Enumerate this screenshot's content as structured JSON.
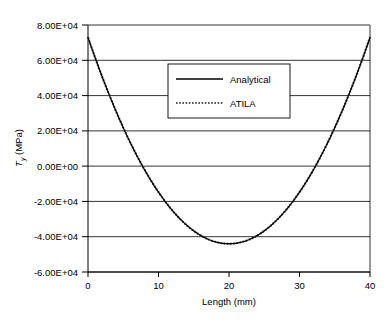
{
  "chart_data": {
    "type": "line",
    "title": "",
    "subtitle": "",
    "xlabel": "Length (mm)",
    "ylabel": "T_y (MPa)",
    "ylabel_symbol": "T",
    "ylabel_subscript": "y",
    "ylabel_units": " (MPa)",
    "xlim": [
      0,
      40
    ],
    "ylim": [
      -60000,
      80000
    ],
    "xticks": [
      0,
      10,
      20,
      30,
      40
    ],
    "xtick_labels": [
      "0",
      "10",
      "20",
      "30",
      "40"
    ],
    "yticks": [
      80000,
      60000,
      40000,
      20000,
      0,
      -20000,
      -40000,
      -60000
    ],
    "ytick_labels": [
      "8.00E+04",
      "6.00E+04",
      "4.00E+04",
      "2.00E+04",
      "0.00E+00",
      "-2.00E+04",
      "-4.00E+04",
      "-6.00E+04"
    ],
    "grid": "horizontal",
    "legend_position": "upper-center",
    "series": [
      {
        "name": "Analytical",
        "style": "solid",
        "color": "#000000",
        "x": [
          0,
          1,
          2,
          3,
          4,
          5,
          6,
          7,
          8,
          9,
          10,
          11,
          12,
          13,
          14,
          15,
          16,
          17,
          18,
          19,
          20,
          21,
          22,
          23,
          24,
          25,
          26,
          27,
          28,
          29,
          30,
          31,
          32,
          33,
          34,
          35,
          36,
          37,
          38,
          39,
          40
        ],
        "values": [
          73000,
          61848,
          51280,
          41298,
          31900,
          23088,
          14860,
          7218,
          160,
          -6312,
          -12200,
          -17502,
          -22220,
          -26352,
          -29900,
          -32862,
          -35240,
          -37032,
          -38240,
          -38862,
          -39000,
          -38862,
          -38240,
          -37032,
          -35240,
          -32862,
          -29900,
          -26352,
          -22220,
          -17502,
          -12200,
          -6312,
          160,
          7218,
          14860,
          23088,
          31900,
          41298,
          51280,
          61848,
          73000
        ]
      },
      {
        "name": "ATILA",
        "style": "dotted",
        "color": "#444444",
        "x": [
          0,
          1,
          2,
          3,
          4,
          5,
          6,
          7,
          8,
          9,
          10,
          11,
          12,
          13,
          14,
          15,
          16,
          17,
          18,
          19,
          20,
          21,
          22,
          23,
          24,
          25,
          26,
          27,
          28,
          29,
          30,
          31,
          32,
          33,
          34,
          35,
          36,
          37,
          38,
          39,
          40
        ],
        "values": [
          73000,
          61848,
          51280,
          41298,
          31900,
          23088,
          14860,
          7218,
          160,
          -6312,
          -12200,
          -17502,
          -22220,
          -26352,
          -29900,
          -32862,
          -35240,
          -37032,
          -38240,
          -38862,
          -39000,
          -38862,
          -38240,
          -37032,
          -35240,
          -32862,
          -29900,
          -26352,
          -22220,
          -17502,
          -12200,
          -6312,
          160,
          7218,
          14860,
          23088,
          31900,
          41298,
          51280,
          61848,
          73000
        ]
      }
    ],
    "curve_vertex": {
      "x": 20,
      "y": -44000
    },
    "curve_endpoints": {
      "x0": 0,
      "y0": 73000,
      "x1": 40,
      "y1": 73000
    },
    "curve_coefficient": 292.5
  },
  "legend": {
    "items": [
      {
        "label": "Analytical",
        "style": "solid"
      },
      {
        "label": "ATILA",
        "style": "dotted"
      }
    ]
  },
  "axes": {
    "x_title": "Length (mm)",
    "y_title_main": "T",
    "y_title_sub": "y",
    "y_title_rest": " (MPa)"
  }
}
